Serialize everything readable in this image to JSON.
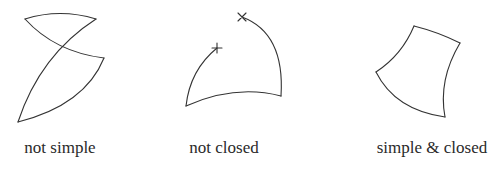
{
  "figure": {
    "panels": [
      {
        "id": "not-simple",
        "label": "not simple",
        "description": "self-intersecting closed curve"
      },
      {
        "id": "not-closed",
        "label": "not closed",
        "description": "open curve with endpoints marked + and ×",
        "markers": {
          "start": "+",
          "end": "×"
        }
      },
      {
        "id": "simple-closed",
        "label": "simple & closed",
        "description": "non-self-intersecting closed curve"
      }
    ],
    "colors": {
      "stroke": "#333333",
      "text": "#2a2a2a",
      "background": "#ffffff"
    }
  }
}
